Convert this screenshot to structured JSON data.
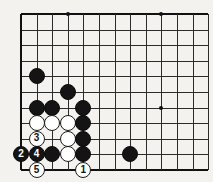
{
  "board": {
    "title": "go-board-diagram",
    "game": "Go",
    "grid": {
      "origin_x": 21,
      "origin_y": 14,
      "spacing": 15.6,
      "cols": 12,
      "rows": 10,
      "line_color": "#2b2b2b",
      "edge_color": "#111111",
      "background_color": "#f4f2ee"
    },
    "star_points": [
      {
        "col": 3,
        "row": 0
      },
      {
        "col": 9,
        "row": 0
      },
      {
        "col": 9,
        "row": 6
      }
    ],
    "colors": {
      "black_stone": "#141414",
      "white_stone": "#ffffff",
      "black_label": "#ffffff",
      "white_label": "#141414"
    },
    "stones": [
      {
        "col": 1,
        "row": 4,
        "color": "black",
        "label": ""
      },
      {
        "col": 3,
        "row": 5,
        "color": "black",
        "label": ""
      },
      {
        "col": 1,
        "row": 6,
        "color": "black",
        "label": ""
      },
      {
        "col": 2,
        "row": 6,
        "color": "black",
        "label": ""
      },
      {
        "col": 4,
        "row": 6,
        "color": "black",
        "label": ""
      },
      {
        "col": 1,
        "row": 7,
        "color": "white",
        "label": ""
      },
      {
        "col": 2,
        "row": 7,
        "color": "white",
        "label": ""
      },
      {
        "col": 3,
        "row": 7,
        "color": "white",
        "label": ""
      },
      {
        "col": 4,
        "row": 7,
        "color": "black",
        "label": ""
      },
      {
        "col": 1,
        "row": 8,
        "color": "white",
        "label": "3"
      },
      {
        "col": 3,
        "row": 8,
        "color": "white",
        "label": ""
      },
      {
        "col": 4,
        "row": 8,
        "color": "black",
        "label": ""
      },
      {
        "col": 0,
        "row": 9,
        "color": "black",
        "label": "2"
      },
      {
        "col": 1,
        "row": 9,
        "color": "black",
        "label": "4"
      },
      {
        "col": 2,
        "row": 9,
        "color": "black",
        "label": ""
      },
      {
        "col": 3,
        "row": 9,
        "color": "white",
        "label": ""
      },
      {
        "col": 4,
        "row": 9,
        "color": "black",
        "label": ""
      },
      {
        "col": 7,
        "row": 9,
        "color": "black",
        "label": ""
      },
      {
        "col": 1,
        "row": 10,
        "color": "white",
        "label": "5"
      },
      {
        "col": 4,
        "row": 10,
        "color": "white",
        "label": "1"
      }
    ],
    "move_sequence": [
      {
        "number": "1",
        "color": "white"
      },
      {
        "number": "2",
        "color": "black"
      },
      {
        "number": "3",
        "color": "white"
      },
      {
        "number": "4",
        "color": "black"
      },
      {
        "number": "5",
        "color": "white"
      }
    ]
  }
}
